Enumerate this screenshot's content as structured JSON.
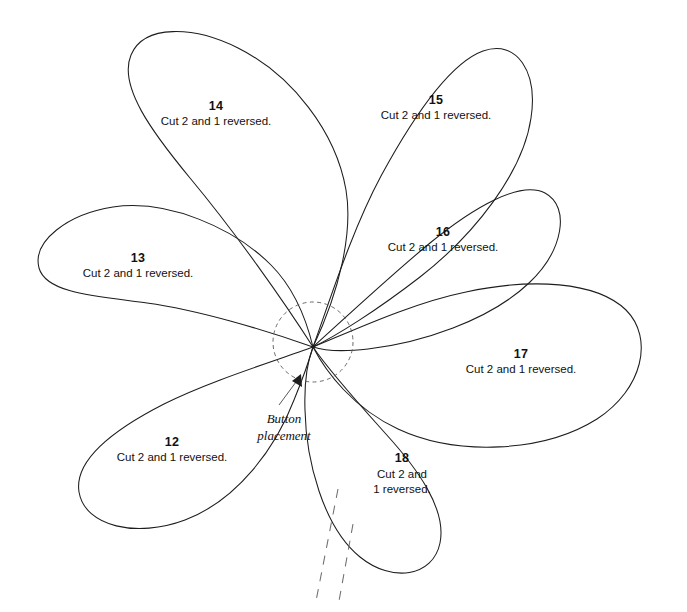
{
  "document": {
    "kind": "sewing-pattern-sheet",
    "title": "Petal pattern pieces",
    "background_color": "#ffffff",
    "ink_color": "#1d1d1d"
  },
  "pattern": {
    "convergence_point": {
      "x": 313,
      "y": 347
    },
    "button_circle": {
      "cx": 313,
      "cy": 342,
      "r": 40,
      "style": "dashed"
    },
    "pieces": [
      {
        "id": "petal-12",
        "number": "12",
        "caption_lines": [
          "Cut 2 and 1 reversed."
        ],
        "label": {
          "x": 172,
          "y": 446
        },
        "direction": "lower-left"
      },
      {
        "id": "petal-13",
        "number": "13",
        "caption_lines": [
          "Cut 2 and 1 reversed."
        ],
        "label": {
          "x": 138,
          "y": 262
        },
        "direction": "left"
      },
      {
        "id": "petal-14",
        "number": "14",
        "caption_lines": [
          "Cut 2 and 1 reversed."
        ],
        "label": {
          "x": 216,
          "y": 110
        },
        "direction": "upper-left"
      },
      {
        "id": "petal-15",
        "number": "15",
        "caption_lines": [
          "Cut 2 and 1 reversed."
        ],
        "label": {
          "x": 436,
          "y": 104
        },
        "direction": "upper-right"
      },
      {
        "id": "petal-16",
        "number": "16",
        "caption_lines": [
          "Cut 2 and 1 reversed."
        ],
        "label": {
          "x": 443,
          "y": 236
        },
        "direction": "right-upper"
      },
      {
        "id": "petal-17",
        "number": "17",
        "caption_lines": [
          "Cut 2 and 1 reversed."
        ],
        "label": {
          "x": 521,
          "y": 358
        },
        "direction": "right"
      },
      {
        "id": "petal-18",
        "number": "18",
        "caption_lines": [
          "Cut 2 and",
          "1 reversed."
        ],
        "label": {
          "x": 402,
          "y": 462
        },
        "direction": "down"
      }
    ]
  },
  "annotations": {
    "button_placement": {
      "lines": [
        "Button",
        "placement"
      ],
      "text_anchor": {
        "x": 284,
        "y": 418
      },
      "leader_from": {
        "x": 280,
        "y": 404
      },
      "leader_to": {
        "x": 299,
        "y": 380
      }
    }
  },
  "fold_lines": [
    {
      "x1": 338,
      "y1": 489,
      "x2": 316,
      "y2": 601
    },
    {
      "x1": 353,
      "y1": 524,
      "x2": 339,
      "y2": 601
    }
  ]
}
